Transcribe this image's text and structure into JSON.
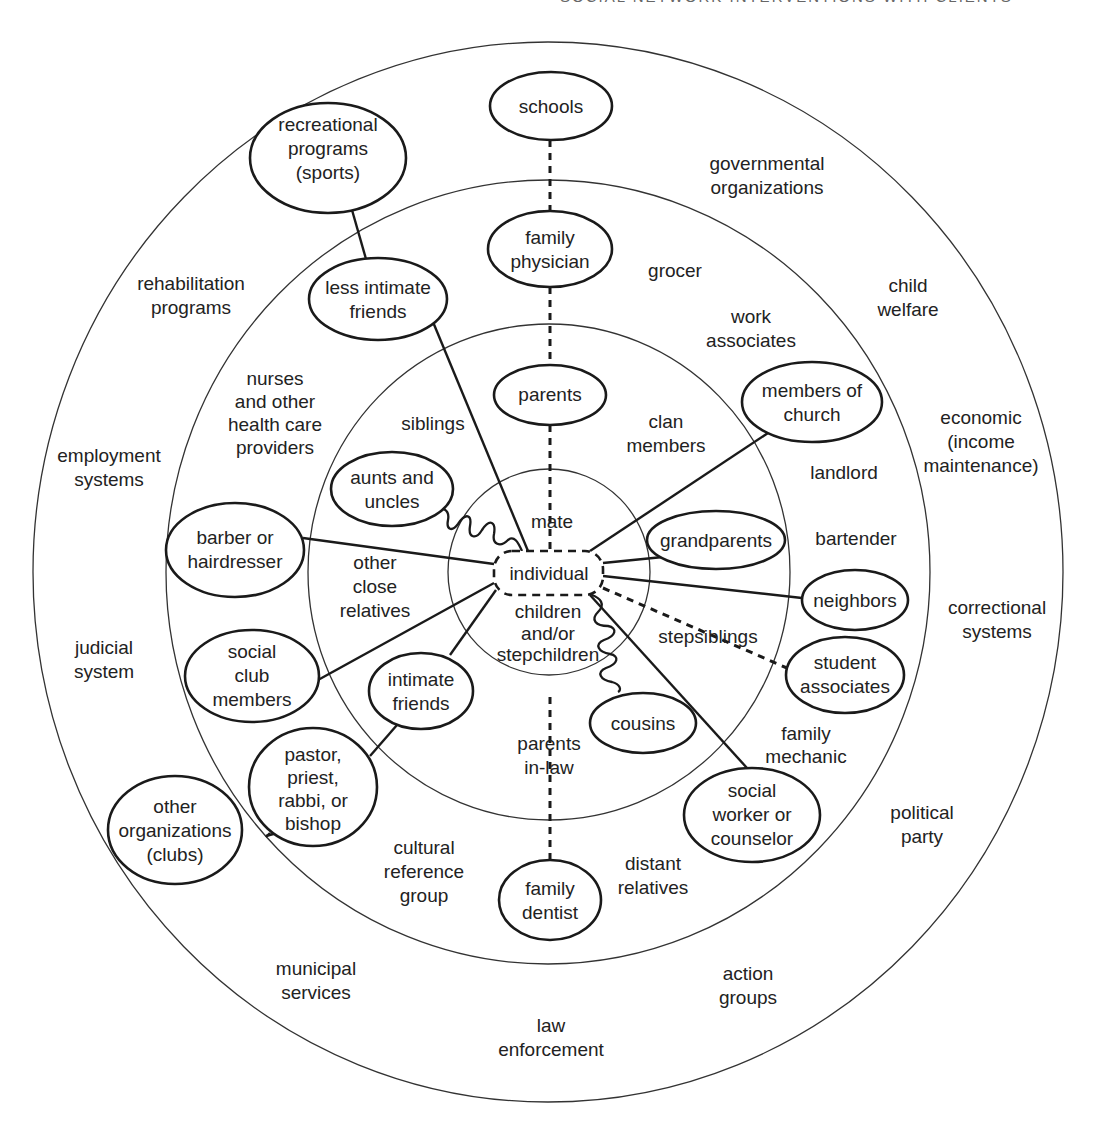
{
  "header": {
    "text": "SOCIAL NETWORK INTERVENTIONS WITH CLIENTS"
  },
  "diagram": {
    "center": {
      "label": "individual"
    },
    "rings": [
      {
        "name": "inner",
        "cx": 549,
        "cy": 572,
        "rx": 101,
        "ry": 103
      },
      {
        "name": "third",
        "cx": 549,
        "cy": 572,
        "rx": 241,
        "ry": 248
      },
      {
        "name": "second",
        "cx": 548,
        "cy": 572,
        "rx": 382,
        "ry": 392
      },
      {
        "name": "outer",
        "cx": 548,
        "cy": 572,
        "rx": 515,
        "ry": 530
      }
    ],
    "nodes": {
      "schools": [
        "schools"
      ],
      "family_physician": [
        "family",
        "physician"
      ],
      "recreational_programs": [
        "recreational",
        "programs",
        "(sports)"
      ],
      "less_intimate_friends": [
        "less intimate",
        "friends"
      ],
      "parents": [
        "parents"
      ],
      "members_of_church": [
        "members of",
        "church"
      ],
      "aunts_and_uncles": [
        "aunts and",
        "uncles"
      ],
      "grandparents": [
        "grandparents"
      ],
      "barber": [
        "barber or",
        "hairdresser"
      ],
      "neighbors": [
        "neighbors"
      ],
      "social_club_members": [
        "social",
        "club",
        "members"
      ],
      "intimate_friends": [
        "intimate",
        "friends"
      ],
      "student_associates": [
        "student",
        "associates"
      ],
      "cousins": [
        "cousins"
      ],
      "pastor": [
        "pastor,",
        "priest,",
        "rabbi, or",
        "bishop"
      ],
      "other_organizations": [
        "other",
        "organizations",
        "(clubs)"
      ],
      "social_worker": [
        "social",
        "worker or",
        "counselor"
      ],
      "family_dentist": [
        "family",
        "dentist"
      ]
    },
    "labels": {
      "mate": [
        "mate"
      ],
      "children": [
        "children",
        "and/or",
        "stepchildren"
      ],
      "siblings": [
        "siblings"
      ],
      "other_close_relatives": [
        "other",
        "close",
        "relatives"
      ],
      "clan_members": [
        "clan",
        "members"
      ],
      "stepsiblings": [
        "stepsiblings"
      ],
      "parents_in_law": [
        "parents",
        "in-law"
      ],
      "nurses": [
        "nurses",
        "and other",
        "health care",
        "providers"
      ],
      "grocer": [
        "grocer"
      ],
      "work_associates": [
        "work",
        "associates"
      ],
      "landlord": [
        "landlord"
      ],
      "bartender": [
        "bartender"
      ],
      "family_mechanic": [
        "family",
        "mechanic"
      ],
      "distant_relatives": [
        "distant",
        "relatives"
      ],
      "cultural_reference_group": [
        "cultural",
        "reference",
        "group"
      ],
      "governmental_organizations": [
        "governmental",
        "organizations"
      ],
      "rehabilitation_programs": [
        "rehabilitation",
        "programs"
      ],
      "child_welfare": [
        "child",
        "welfare"
      ],
      "employment_systems": [
        "employment",
        "systems"
      ],
      "economic": [
        "economic",
        "(income",
        "maintenance)"
      ],
      "judicial_system": [
        "judicial",
        "system"
      ],
      "correctional_systems": [
        "correctional",
        "systems"
      ],
      "political_party": [
        "political",
        "party"
      ],
      "municipal_services": [
        "municipal",
        "services"
      ],
      "action_groups": [
        "action",
        "groups"
      ],
      "law_enforcement": [
        "law",
        "enforcement"
      ]
    }
  }
}
